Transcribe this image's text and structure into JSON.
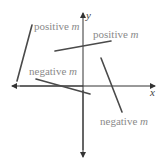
{
  "diagram": {
    "title": "",
    "axes": {
      "x_label": "x",
      "y_label": "y"
    },
    "segments": [
      {
        "id": "steep-positive",
        "slope_sign": "positive",
        "label_text": "positive ",
        "label_var": "m"
      },
      {
        "id": "shallow-positive",
        "slope_sign": "positive",
        "label_text": "positive ",
        "label_var": "m"
      },
      {
        "id": "shallow-negative",
        "slope_sign": "negative",
        "label_text": "negative ",
        "label_var": "m"
      },
      {
        "id": "steep-negative",
        "slope_sign": "negative",
        "label_text": "negative ",
        "label_var": "m"
      }
    ],
    "colors": {
      "line": "#4a4a4a",
      "label": "#8a8a8a",
      "axis": "#333333"
    }
  }
}
